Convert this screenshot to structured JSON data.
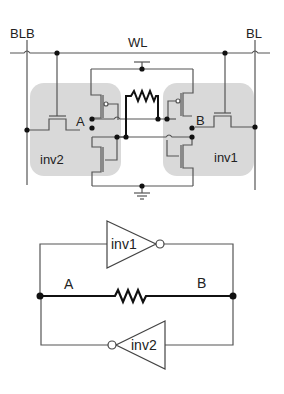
{
  "schematic": {
    "labels": {
      "blb": "BLB",
      "wl": "WL",
      "bl": "BL",
      "node_a": "A",
      "node_b": "B",
      "inv2": "inv2",
      "inv1": "inv1"
    }
  },
  "logic_diagram": {
    "labels": {
      "inv1": "inv1",
      "inv2": "inv2",
      "node_a": "A",
      "node_b": "B"
    }
  },
  "colors": {
    "wire": "#555555",
    "bold_wire": "#111111",
    "inverter_box": "#d9d9d9",
    "node": "#111111"
  }
}
